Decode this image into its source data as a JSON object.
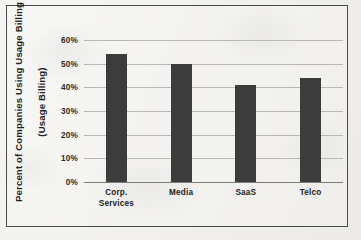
{
  "chart_data": {
    "type": "bar",
    "title": "",
    "xlabel": "",
    "ylabel": "Percent of Companies Using Usage Billing",
    "ylabel_line2": "(Usage Billing)",
    "categories": [
      "Corp.\nServices",
      "Media",
      "SaaS",
      "Telco"
    ],
    "category_plain": [
      "Corp. Services",
      "Media",
      "SaaS",
      "Telco"
    ],
    "values": [
      54,
      50,
      41,
      44
    ],
    "value_labels": [
      "54%",
      "50%",
      "41%",
      "44%"
    ],
    "ylim": [
      0,
      60
    ],
    "ytick_labels": [
      "60%",
      "50%",
      "40%",
      "30%",
      "20%",
      "10%",
      "0%"
    ],
    "ytick_values": [
      60,
      50,
      40,
      30,
      20,
      10,
      0
    ],
    "grid": "horizontal",
    "legend": "none",
    "bar_color": "#3c3c3c",
    "grid_color": "#b9b8b4",
    "axis_color": "#7c7b78",
    "frame_color": "#4a4a48",
    "background_color": "#f2f1ee"
  }
}
